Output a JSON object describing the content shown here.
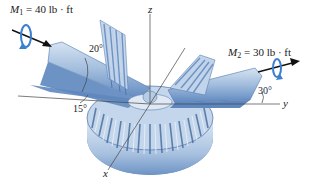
{
  "figure": {
    "moments": [
      {
        "symbol": "M",
        "subscript": "1",
        "value": "= 40 lb · ft"
      },
      {
        "symbol": "M",
        "subscript": "2",
        "value": "= 30 lb · ft"
      }
    ],
    "axes": {
      "x": "x",
      "y": "y",
      "z": "z"
    },
    "angles": {
      "a20": "20°",
      "a15": "15°",
      "a30": "30°"
    },
    "colors": {
      "gear_light": "#c9d9ec",
      "gear_mid": "#8fb0d6",
      "gear_dark": "#4f78ad",
      "shaft_blue": "#5e87bf",
      "moment_arrow": "#3a7fd0",
      "axis_line": "#444444"
    }
  }
}
